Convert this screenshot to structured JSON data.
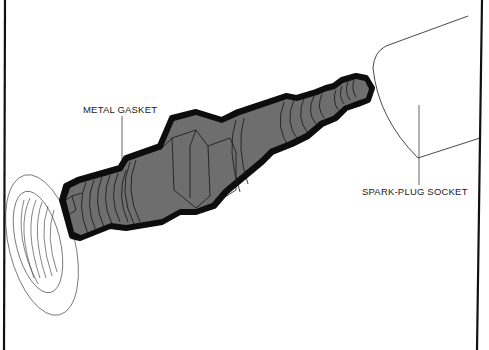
{
  "diagram": {
    "labels": {
      "metal_gasket": "METAL GASKET",
      "spark_plug_socket": "SPARK-PLUG SOCKET"
    },
    "parts": [
      "cylinder-head-thread-hole",
      "spark-plug",
      "metal-gasket",
      "hex-nut",
      "ceramic-insulator",
      "terminal-tip",
      "spark-plug-socket"
    ],
    "colors": {
      "plug_fill": "#6e6e6e",
      "outline": "#0d0d0d",
      "line": "#222222",
      "background": "#ffffff"
    }
  }
}
